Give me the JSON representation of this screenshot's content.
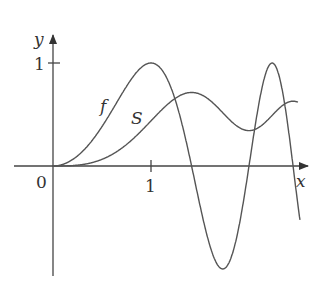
{
  "chart_data": {
    "type": "line",
    "title": "",
    "xlabel": "x",
    "ylabel": "y",
    "origin_label": "0",
    "x_ticks": [
      {
        "value": 1,
        "label": "1"
      }
    ],
    "y_ticks": [
      {
        "value": 1,
        "label": "1"
      }
    ],
    "xlim": [
      0,
      2.6
    ],
    "ylim": [
      -1,
      1.3
    ],
    "grid": false,
    "legend": "inline curve labels",
    "series": [
      {
        "name": "f",
        "label": "f",
        "description": "f(x) = sin(πx²/2)",
        "x": [
          0,
          0.25,
          0.5,
          0.75,
          1.0,
          1.25,
          1.5,
          1.75,
          2.0,
          2.25,
          2.5
        ],
        "values": [
          0,
          0.098,
          0.383,
          0.773,
          1.0,
          0.556,
          -0.707,
          -0.934,
          0.0,
          0.924,
          0.707
        ]
      },
      {
        "name": "S",
        "label": "S",
        "description": "S(x) = ∫₀ˣ sin(πt²/2) dt (Fresnel)",
        "x": [
          0,
          0.25,
          0.5,
          0.75,
          1.0,
          1.25,
          1.5,
          1.75,
          2.0,
          2.25,
          2.5
        ],
        "values": [
          0,
          0.008,
          0.065,
          0.209,
          0.438,
          0.697,
          0.697,
          0.499,
          0.343,
          0.529,
          0.619
        ]
      }
    ],
    "colors": {
      "line": "#555555",
      "axis": "#444444",
      "text": "#333333"
    }
  }
}
